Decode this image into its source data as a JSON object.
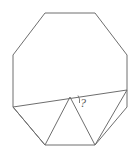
{
  "figure": {
    "name": "octagon-with-inscribed-triangle",
    "type": "geometry-diagram",
    "background_color": "#ffffff",
    "stroke_color": "#6e6e6e",
    "canvas": {
      "width": 138,
      "height": 154
    },
    "octagon": {
      "label": "regular-octagon",
      "vertices": [
        {
          "id": "top-left",
          "x": 45,
          "y": 13
        },
        {
          "id": "top-right",
          "x": 95,
          "y": 13
        },
        {
          "id": "right-upper",
          "x": 127,
          "y": 55
        },
        {
          "id": "right-lower",
          "x": 127,
          "y": 107
        },
        {
          "id": "bottom-right",
          "x": 95,
          "y": 145
        },
        {
          "id": "bottom-left",
          "x": 45,
          "y": 145
        },
        {
          "id": "left-lower",
          "x": 13,
          "y": 107
        },
        {
          "id": "left-upper",
          "x": 13,
          "y": 55
        }
      ],
      "points_string": "45,13 95,13 127,55 127,107 95,145 45,145 13,107 13,55"
    },
    "chord": {
      "label": "chord-from-left-lower-vertex-to-right-edge",
      "start": {
        "x": 13,
        "y": 107
      },
      "end": {
        "x": 127,
        "y": 90
      },
      "path": "M 13 107 L 127 90"
    },
    "triangle": {
      "label": "inscribed-triangle",
      "apex": {
        "x": 70,
        "y": 97
      },
      "base_left": {
        "x": 45,
        "y": 145
      },
      "base_right": {
        "x": 95,
        "y": 145
      },
      "path": "M 45 145 L 70 97 L 95 145"
    },
    "chord_legs": {
      "label": "triangle-legs-to-octagon-corners",
      "left_leg": "M 13 107 L 45 145",
      "right_leg": "M 95 145 L 127 90"
    },
    "angle_marker": {
      "label": "unknown-angle",
      "value_text": "?",
      "arc_path": "M 78 95.5 A 10 10 0 0 1 79.5 103",
      "text_position": {
        "x": 80,
        "y": 107
      },
      "vertex": {
        "x": 70,
        "y": 97
      }
    }
  }
}
